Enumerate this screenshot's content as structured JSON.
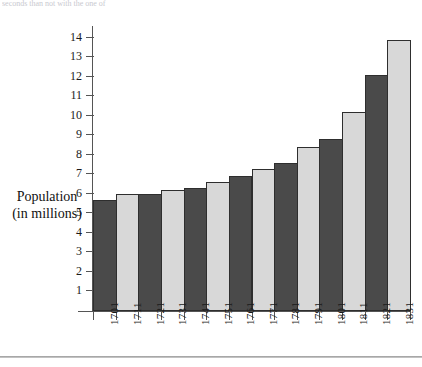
{
  "page": {
    "top_text_sliver": "seconds than not with the one of"
  },
  "chart_data": {
    "type": "bar",
    "title": "",
    "xlabel": "",
    "ylabel": "Population (in millions)",
    "ylabel_lines": [
      "Population",
      "(in millions)"
    ],
    "categories": [
      "1701",
      "1711",
      "1721",
      "1731",
      "1741",
      "1751",
      "1761",
      "1771",
      "1781",
      "1791",
      "1801",
      "1811",
      "1821",
      "1831"
    ],
    "values": [
      5.7,
      6.0,
      6.0,
      6.2,
      6.3,
      6.6,
      6.9,
      7.3,
      7.6,
      8.4,
      8.8,
      10.2,
      12.1,
      13.9
    ],
    "bar_colors": [
      "dark",
      "light",
      "dark",
      "light",
      "dark",
      "light",
      "dark",
      "light",
      "dark",
      "light",
      "dark",
      "light",
      "dark",
      "light"
    ],
    "ylim": [
      0,
      14.6
    ],
    "yticks": [
      1,
      2,
      3,
      4,
      5,
      6,
      7,
      8,
      9,
      10,
      11,
      12,
      13,
      14
    ],
    "ytick_labels": [
      "1",
      "2",
      "3",
      "4",
      "5",
      "6",
      "7",
      "8",
      "9",
      "10",
      "11",
      "12",
      "13",
      "14"
    ],
    "grid": false,
    "legend": null,
    "colors": {
      "dark_bar": "#4a4a4a",
      "light_bar": "#d8d8d8",
      "bar_edge": "#2e2e2e",
      "axis": "#555555",
      "text": "#1a1a1a"
    }
  }
}
